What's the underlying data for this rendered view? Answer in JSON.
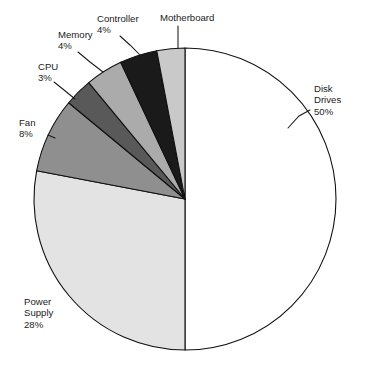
{
  "chart_data": {
    "type": "pie",
    "title": "",
    "subtitle": "",
    "xlabel": "",
    "ylabel": "",
    "legend": "none",
    "grid": false,
    "units": "percent",
    "total": 100,
    "start_angle_deg": 0,
    "direction": "clockwise",
    "categories": [
      "Disk Drives",
      "Power Supply",
      "Fan",
      "CPU",
      "Memory",
      "Controller",
      "Motherboard"
    ],
    "values": [
      50,
      28,
      8,
      3,
      4,
      4,
      3
    ],
    "slices": [
      {
        "name": "disk-drives",
        "label": "Disk",
        "label_line2": "Drives",
        "percent_text": "50%",
        "value": 50,
        "color": "#ffffff",
        "start_deg": 0,
        "end_deg": 180,
        "label_x": 314,
        "label_y": 92,
        "label_anchor": "start",
        "leader": "M 310 110 L 299 116 L 288 128"
      },
      {
        "name": "power-supply",
        "label": "Power",
        "label_line2": "Supply",
        "percent_text": "28%",
        "value": 28,
        "color": "#e3e3e3",
        "start_deg": 180,
        "end_deg": 280.8,
        "label_x": 24,
        "label_y": 305,
        "label_anchor": "start",
        "leader": ""
      },
      {
        "name": "fan",
        "label": "Fan",
        "label_line2": "",
        "percent_text": "8%",
        "value": 8,
        "color": "#8f8f8f",
        "start_deg": 280.8,
        "end_deg": 309.6,
        "label_x": 19,
        "label_y": 126,
        "label_anchor": "start",
        "leader": "M 48 135 L 55 138"
      },
      {
        "name": "cpu",
        "label": "CPU",
        "label_line2": "",
        "percent_text": "3%",
        "value": 3,
        "color": "#595959",
        "start_deg": 309.6,
        "end_deg": 320.4,
        "label_x": 38,
        "label_y": 70,
        "label_anchor": "start",
        "leader": "M 54 82 L 64 90 L 75 99"
      },
      {
        "name": "memory",
        "label": "Memory",
        "label_line2": "",
        "percent_text": "4%",
        "value": 4,
        "color": "#ababab",
        "start_deg": 320.4,
        "end_deg": 334.8,
        "label_x": 58,
        "label_y": 38,
        "label_anchor": "start",
        "leader": "M 78 52 L 90 62 L 103 72"
      },
      {
        "name": "controller",
        "label": "Controller",
        "label_line2": "",
        "percent_text": "4%",
        "value": 4,
        "color": "#1a1a1a",
        "start_deg": 334.8,
        "end_deg": 349.2,
        "label_x": 97,
        "label_y": 22,
        "label_anchor": "start",
        "leader": "M 120 36 L 130 45 L 141 56"
      },
      {
        "name": "motherboard",
        "label": "Motherboard",
        "label_line2": "",
        "percent_text": "",
        "value": 3,
        "color": "#c9c9c9",
        "start_deg": 349.2,
        "end_deg": 360,
        "label_x": 160,
        "label_y": 21,
        "label_anchor": "start",
        "leader": "M 178 26 L 178 48"
      }
    ],
    "geometry": {
      "center_x": 185,
      "center_y": 199,
      "radius": 151
    },
    "colors": {
      "outline": "#111111",
      "text": "#1c1c1c",
      "background": "#ffffff"
    }
  }
}
